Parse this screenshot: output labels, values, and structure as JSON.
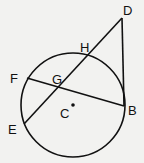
{
  "diagram": {
    "type": "geometry",
    "colors": {
      "stroke": "#111111",
      "background": "#f2f2f0"
    },
    "circle": {
      "center_label": "C",
      "cx": 73,
      "cy": 105,
      "r": 52
    },
    "points": {
      "D": {
        "label": "D",
        "x": 122,
        "y": 18
      },
      "H": {
        "label": "H",
        "x": 88,
        "y": 55
      },
      "G": {
        "label": "G",
        "x": 59,
        "y": 86
      },
      "F": {
        "label": "F",
        "x": 27,
        "y": 78
      },
      "E": {
        "label": "E",
        "x": 24,
        "y": 124
      },
      "B": {
        "label": "B",
        "x": 124,
        "y": 106
      },
      "C": {
        "label": "C",
        "x": 73,
        "y": 105
      }
    },
    "segments": [
      {
        "from": "D",
        "to": "E",
        "name": "secant DE"
      },
      {
        "from": "D",
        "to": "B",
        "name": "tangent DB"
      },
      {
        "from": "F",
        "to": "B",
        "name": "chord FB"
      }
    ]
  }
}
